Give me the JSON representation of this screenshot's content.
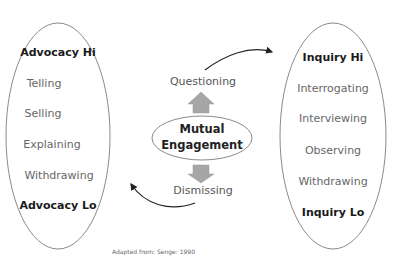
{
  "left_ellipse": {
    "items": [
      {
        "label": "Advocacy Hi",
        "bold": true
      },
      {
        "label": "Telling",
        "bold": false
      },
      {
        "label": "Selling",
        "bold": false
      },
      {
        "label": "Explaining",
        "bold": false
      },
      {
        "label": "Withdrawing",
        "bold": false
      },
      {
        "label": "Advocacy Lo",
        "bold": true
      }
    ]
  },
  "right_ellipse": {
    "items": [
      {
        "label": "Inquiry Hi",
        "bold": true
      },
      {
        "label": "Interrogating",
        "bold": false
      },
      {
        "label": "Interviewing",
        "bold": false
      },
      {
        "label": "Observing",
        "bold": false
      },
      {
        "label": "Withdrawing",
        "bold": false
      },
      {
        "label": "Inquiry Lo",
        "bold": true
      }
    ]
  },
  "center": {
    "top_label": "Questioning",
    "mutual_line1": "Mutual",
    "mutual_line2": "Engagement",
    "bottom_label": "Dismissing"
  },
  "caption": "Adapted from: Senge: 1990",
  "colors": {
    "ellipse_stroke": "#8a8a8a",
    "block_arrow_fill": "#a6a6a6",
    "curve_arrow": "#222222"
  }
}
